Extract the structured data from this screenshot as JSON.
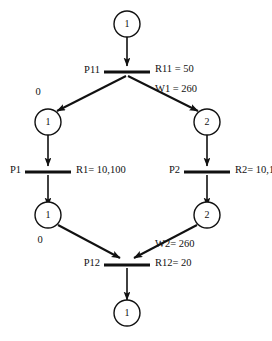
{
  "diagram": {
    "type": "petri-net",
    "title": "",
    "places": [
      {
        "id": "p-top",
        "label": "1",
        "cx": 127,
        "cy": 24,
        "r": 13
      },
      {
        "id": "p-mid-left",
        "label": "1",
        "cx": 48,
        "cy": 122,
        "r": 13
      },
      {
        "id": "p-mid-right",
        "label": "2",
        "cx": 207,
        "cy": 122,
        "r": 13
      },
      {
        "id": "p-lower-left",
        "label": "1",
        "cx": 48,
        "cy": 215,
        "r": 13
      },
      {
        "id": "p-lower-right",
        "label": "2",
        "cx": 207,
        "cy": 215,
        "r": 13
      },
      {
        "id": "p-bottom",
        "label": "1",
        "cx": 127,
        "cy": 313,
        "r": 13
      }
    ],
    "transitions": [
      {
        "id": "t-p11",
        "name": "P11",
        "cx": 127,
        "cy": 72,
        "half_width": 23,
        "left_label": "P11",
        "right_label": "R11 = 50",
        "sub_label": "W1 = 260"
      },
      {
        "id": "t-p1",
        "name": "P1",
        "cx": 48,
        "cy": 172,
        "half_width": 23,
        "left_label": "P1",
        "right_label": "R1= 10,100",
        "sub_label": ""
      },
      {
        "id": "t-p2",
        "name": "P2",
        "cx": 207,
        "cy": 172,
        "half_width": 23,
        "left_label": "P2",
        "right_label": "R2= 10,100",
        "sub_label": ""
      },
      {
        "id": "t-p12",
        "name": "P12",
        "cx": 127,
        "cy": 265,
        "half_width": 23,
        "left_label": "P12",
        "right_label": "R12= 20",
        "sub_label": "W2= 260"
      }
    ],
    "arc_labels": [
      {
        "id": "arc-label-left-top",
        "text": "0",
        "x": 38,
        "y": 93
      },
      {
        "id": "arc-label-left-bottom",
        "text": "0",
        "x": 40,
        "y": 241
      }
    ],
    "weights": {
      "w1": "W1 = 260",
      "w2": "W2= 260"
    },
    "rates": {
      "r11": "R11 = 50",
      "r1": "R1= 10,100",
      "r2": "R2= 10,100",
      "r12": "R12= 20"
    },
    "colors": {
      "stroke": "#111111",
      "background": "#ffffff"
    }
  }
}
